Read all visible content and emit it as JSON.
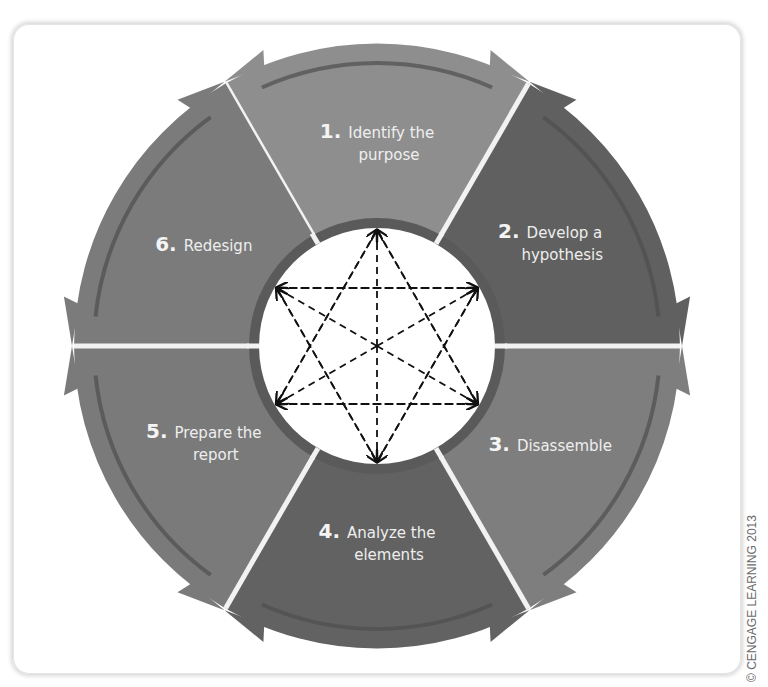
{
  "diagram": {
    "type": "cycle",
    "steps": [
      {
        "number": "1.",
        "line1": "Identify the",
        "line2": "purpose",
        "color": "#8e8e8e"
      },
      {
        "number": "2.",
        "line1": "Develop a",
        "line2": "hypothesis",
        "color": "#606060"
      },
      {
        "number": "3.",
        "line1": "Disassemble",
        "line2": "",
        "color": "#7e7e7e"
      },
      {
        "number": "4.",
        "line1": "Analyze the",
        "line2": "elements",
        "color": "#626262"
      },
      {
        "number": "5.",
        "line1": "Prepare the",
        "line2": "report",
        "color": "#7a7a7a"
      },
      {
        "number": "6.",
        "line1": "Redesign",
        "line2": "",
        "color": "#7b7b7b"
      }
    ],
    "center": {
      "label": "interconnections",
      "shape": "hexagram-with-diameters"
    },
    "colors": {
      "divider": "#f2f2f2",
      "stripe": "#4e4e4e",
      "center_fill": "#ffffff",
      "center_ring": "#5a5a5a",
      "dash": "#111111"
    }
  },
  "credit": "© CENGAGE LEARNING 2013"
}
